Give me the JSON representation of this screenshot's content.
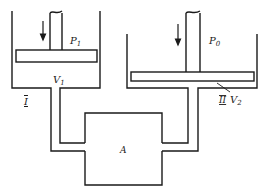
{
  "diagram": {
    "labels": {
      "p1": "P",
      "p1_sub": "1",
      "p0": "P",
      "p0_sub": "0",
      "v1": "V",
      "v1_sub": "1",
      "v2": "V",
      "v2_sub": "2",
      "vessel_left": "I",
      "vessel_right": "II",
      "chamber": "A"
    },
    "colors": {
      "stroke": "#1a1a1a",
      "background": "#ffffff"
    }
  }
}
